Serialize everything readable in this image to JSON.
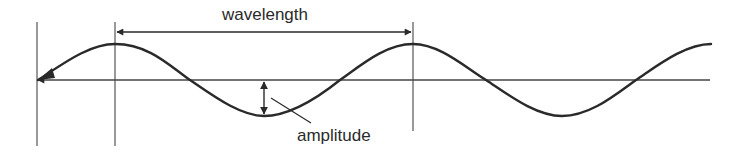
{
  "diagram": {
    "labels": {
      "wavelength": "wavelength",
      "amplitude": "amplitude"
    },
    "colors": {
      "line": "#2a2a2a",
      "guide": "#555555",
      "background": "#ffffff"
    }
  }
}
